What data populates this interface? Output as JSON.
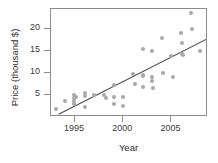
{
  "chart_data": {
    "type": "scatter",
    "title": "",
    "xlabel": "Year",
    "ylabel": "Price (thousand $)",
    "xlim": [
      1992.5,
      2008.8
    ],
    "ylim": [
      0,
      24.5
    ],
    "xticks": [
      1995,
      2000,
      2005
    ],
    "xticklabels": [
      "1995",
      "2000",
      "2005"
    ],
    "yticks": [
      5,
      10,
      15,
      20
    ],
    "yticklabels": [
      "5",
      "10",
      "15",
      "20"
    ],
    "grid": false,
    "legend": null,
    "point_color": "#a8a8a8",
    "line_color": "#4a4a4a",
    "frame_color": "#8c8c8c",
    "points": [
      {
        "x": 1993.0,
        "y": 1.8
      },
      {
        "x": 1994.0,
        "y": 3.6
      },
      {
        "x": 1994.9,
        "y": 5.0
      },
      {
        "x": 1994.9,
        "y": 4.3
      },
      {
        "x": 1994.9,
        "y": 3.6
      },
      {
        "x": 1994.9,
        "y": 2.9
      },
      {
        "x": 1995.1,
        "y": 4.6
      },
      {
        "x": 1996.0,
        "y": 5.4
      },
      {
        "x": 1996.0,
        "y": 4.7
      },
      {
        "x": 1996.0,
        "y": 2.2
      },
      {
        "x": 1997.0,
        "y": 5.0
      },
      {
        "x": 1998.0,
        "y": 4.9
      },
      {
        "x": 1998.2,
        "y": 4.4
      },
      {
        "x": 1999.0,
        "y": 7.3
      },
      {
        "x": 1999.0,
        "y": 4.5
      },
      {
        "x": 1999.0,
        "y": 3.0
      },
      {
        "x": 2000.0,
        "y": 4.5
      },
      {
        "x": 2000.0,
        "y": 2.6
      },
      {
        "x": 2001.0,
        "y": 9.8
      },
      {
        "x": 2001.2,
        "y": 7.6
      },
      {
        "x": 2002.0,
        "y": 15.5
      },
      {
        "x": 2002.0,
        "y": 9.6
      },
      {
        "x": 2002.1,
        "y": 9.2
      },
      {
        "x": 2002.1,
        "y": 6.9
      },
      {
        "x": 2003.0,
        "y": 15.0
      },
      {
        "x": 2003.0,
        "y": 9.0
      },
      {
        "x": 2003.0,
        "y": 8.2
      },
      {
        "x": 2003.1,
        "y": 6.6
      },
      {
        "x": 2004.0,
        "y": 18.0
      },
      {
        "x": 2004.1,
        "y": 9.9
      },
      {
        "x": 2005.0,
        "y": 13.9
      },
      {
        "x": 2005.2,
        "y": 9.1
      },
      {
        "x": 2006.0,
        "y": 19.1
      },
      {
        "x": 2006.1,
        "y": 16.9
      },
      {
        "x": 2006.1,
        "y": 14.4
      },
      {
        "x": 2006.2,
        "y": 14.0
      },
      {
        "x": 2007.0,
        "y": 23.6
      },
      {
        "x": 2007.1,
        "y": 19.9
      },
      {
        "x": 2008.0,
        "y": 15.0
      }
    ],
    "trendline": {
      "x1": 1993.3,
      "y1": 0.6,
      "x2": 2008.6,
      "y2": 17.6
    }
  }
}
